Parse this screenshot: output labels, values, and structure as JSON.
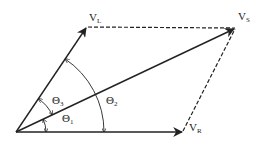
{
  "diagram": {
    "colors": {
      "line": "#222222",
      "background": "#ffffff"
    },
    "origin": [
      16,
      132
    ],
    "vectors": [
      {
        "id": "VR",
        "label_main": "V",
        "label_sub": "R",
        "tip": [
          182,
          132
        ],
        "style": "solid"
      },
      {
        "id": "VS",
        "label_main": "V",
        "label_sub": "S",
        "tip": [
          235,
          28
        ],
        "style": "solid"
      },
      {
        "id": "VL",
        "label_main": "V",
        "label_sub": "L",
        "tip": [
          87,
          27
        ],
        "style": "solid"
      }
    ],
    "dashed_lines": [
      {
        "from": "VL",
        "to": "VS"
      },
      {
        "from": "VR",
        "to": "VS"
      }
    ],
    "angles": [
      {
        "id": "theta1",
        "label_main": "Θ",
        "label_sub": "1",
        "between": [
          "VR",
          "VS"
        ]
      },
      {
        "id": "theta2",
        "label_main": "Θ",
        "label_sub": "2",
        "between": [
          "VR",
          "VL"
        ]
      },
      {
        "id": "theta3",
        "label_main": "Θ",
        "label_sub": "3",
        "between": [
          "VS",
          "VL"
        ]
      }
    ]
  }
}
